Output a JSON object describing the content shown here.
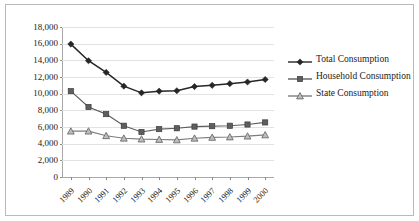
{
  "chart_data": {
    "type": "line",
    "title": "",
    "xlabel": "",
    "ylabel": "",
    "grid": true,
    "legend_position": "right",
    "ylim": [
      0,
      18000
    ],
    "ytick_step": 2000,
    "yticks": [
      "0",
      "2,000",
      "4,000",
      "6,000",
      "8,000",
      "10,000",
      "12,000",
      "14,000",
      "16,000",
      "18,000"
    ],
    "categories": [
      "1989",
      "1990",
      "1991",
      "1992",
      "1993",
      "1994",
      "1995",
      "1996",
      "1997",
      "1998",
      "1999",
      "2000"
    ],
    "series": [
      {
        "name": "Total Consumption",
        "marker": "diamond",
        "color": "#262626",
        "values": [
          15950,
          13950,
          12550,
          10900,
          10100,
          10300,
          10350,
          10850,
          11000,
          11200,
          11400,
          11700
        ]
      },
      {
        "name": "Household Consumption",
        "marker": "square",
        "color": "#5e5e5e",
        "values": [
          10300,
          8400,
          7550,
          6150,
          5400,
          5750,
          5850,
          6050,
          6100,
          6150,
          6300,
          6550
        ]
      },
      {
        "name": "State Consumption",
        "marker": "triangle",
        "color": "#7d7d7d",
        "values": [
          5500,
          5500,
          4950,
          4650,
          4550,
          4500,
          4450,
          4650,
          4750,
          4800,
          4900,
          5050
        ]
      }
    ]
  },
  "colors": {
    "grid": "#e2e2e2",
    "axis": "#a8a8a8",
    "border": "#b9b9b9",
    "text": "#1a1a1a",
    "background": "#ffffff"
  }
}
